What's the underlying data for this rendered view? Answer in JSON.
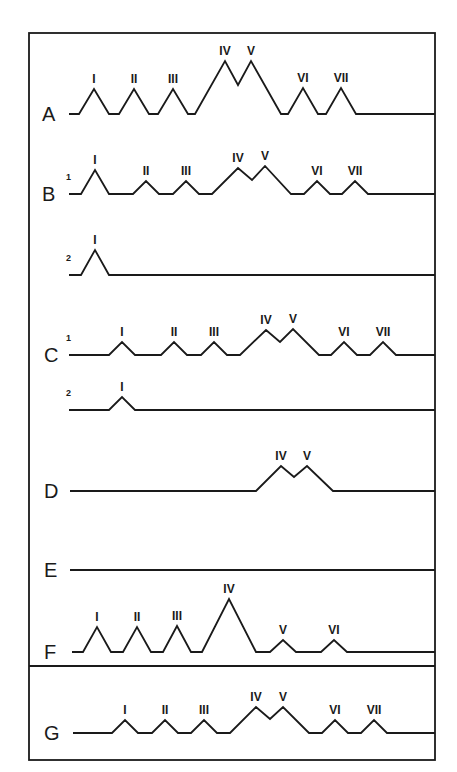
{
  "figure": {
    "frame": {
      "left": 29,
      "top": 33,
      "right": 435,
      "bottom": 760,
      "divider_y": 666
    },
    "stroke_color": "#1a1a1a",
    "background": "#ffffff",
    "rows": [
      {
        "id": "A",
        "label": "A",
        "label_x": 42,
        "baseline": 114,
        "start_x": 69,
        "peaks": [
          {
            "name": "I",
            "x": 94,
            "y": 89,
            "w": 15
          },
          {
            "name": "II",
            "x": 134,
            "y": 89,
            "w": 15
          },
          {
            "name": "III",
            "x": 173,
            "y": 89,
            "w": 15
          },
          {
            "name": "IV",
            "x": 225,
            "y": 61,
            "pair_valley": {
              "x": 238,
              "y": 85
            }
          },
          {
            "name": "V",
            "x": 251,
            "y": 61,
            "w": 30
          },
          {
            "name": "VI",
            "x": 303,
            "y": 88,
            "w": 15
          },
          {
            "name": "VII",
            "x": 341,
            "y": 88,
            "w": 15
          }
        ]
      },
      {
        "id": "B1",
        "label": "B",
        "label_x": 42,
        "sub": "1",
        "baseline": 194,
        "start_x": 69,
        "peaks": [
          {
            "name": "I",
            "x": 95,
            "y": 170,
            "w": 14
          },
          {
            "name": "II",
            "x": 146,
            "y": 181,
            "w": 13
          },
          {
            "name": "III",
            "x": 186,
            "y": 181,
            "w": 13
          },
          {
            "name": "IV",
            "x": 238,
            "y": 168,
            "pair_valley": {
              "x": 252,
              "y": 180
            }
          },
          {
            "name": "V",
            "x": 265,
            "y": 166,
            "w": 26
          },
          {
            "name": "VI",
            "x": 317,
            "y": 181,
            "w": 13
          },
          {
            "name": "VII",
            "x": 355,
            "y": 181,
            "w": 13
          }
        ]
      },
      {
        "id": "B2",
        "label": "",
        "sub": "2",
        "baseline": 275,
        "start_x": 69,
        "peaks": [
          {
            "name": "I",
            "x": 95,
            "y": 250,
            "w": 14
          }
        ]
      },
      {
        "id": "C1",
        "label": "C",
        "label_x": 44,
        "sub": "1",
        "baseline": 355,
        "start_x": 69,
        "peaks": [
          {
            "name": "I",
            "x": 122,
            "y": 342,
            "w": 13
          },
          {
            "name": "II",
            "x": 174,
            "y": 342,
            "w": 13
          },
          {
            "name": "III",
            "x": 214,
            "y": 342,
            "w": 13
          },
          {
            "name": "IV",
            "x": 266,
            "y": 330,
            "pair_valley": {
              "x": 280,
              "y": 342
            }
          },
          {
            "name": "V",
            "x": 293,
            "y": 329,
            "w": 26
          },
          {
            "name": "VI",
            "x": 344,
            "y": 342,
            "w": 13
          },
          {
            "name": "VII",
            "x": 383,
            "y": 342,
            "w": 13
          }
        ]
      },
      {
        "id": "C2",
        "label": "",
        "sub": "2",
        "baseline": 410,
        "start_x": 69,
        "peaks": [
          {
            "name": "I",
            "x": 122,
            "y": 397,
            "w": 13
          }
        ]
      },
      {
        "id": "D",
        "label": "D",
        "label_x": 44,
        "baseline": 491,
        "start_x": 70,
        "peaks": [
          {
            "name": "IV",
            "x": 281,
            "y": 466,
            "pair_valley": {
              "x": 294,
              "y": 477
            },
            "start_x": 256
          },
          {
            "name": "V",
            "x": 307,
            "y": 466,
            "w": 26
          }
        ]
      },
      {
        "id": "E",
        "label": "E",
        "label_x": 44,
        "baseline": 570,
        "start_x": 70,
        "peaks": []
      },
      {
        "id": "F",
        "label": "F",
        "label_x": 44,
        "baseline": 652,
        "start_x": 72,
        "peaks": [
          {
            "name": "I",
            "x": 97,
            "y": 627,
            "w": 14
          },
          {
            "name": "II",
            "x": 137,
            "y": 627,
            "w": 14
          },
          {
            "name": "III",
            "x": 177,
            "y": 626,
            "w": 14
          },
          {
            "name": "IV",
            "x": 229,
            "y": 599,
            "w": 27
          },
          {
            "name": "V",
            "x": 283,
            "y": 640,
            "w": 13
          },
          {
            "name": "VI",
            "x": 334,
            "y": 640,
            "w": 13
          }
        ]
      },
      {
        "id": "G",
        "label": "G",
        "label_x": 44,
        "baseline": 733,
        "start_x": 73,
        "peaks": [
          {
            "name": "I",
            "x": 125,
            "y": 720,
            "w": 13
          },
          {
            "name": "II",
            "x": 165,
            "y": 720,
            "w": 13
          },
          {
            "name": "III",
            "x": 204,
            "y": 720,
            "w": 13
          },
          {
            "name": "IV",
            "x": 256,
            "y": 707,
            "pair_valley": {
              "x": 270,
              "y": 719
            }
          },
          {
            "name": "V",
            "x": 283,
            "y": 707,
            "w": 26
          },
          {
            "name": "VI",
            "x": 335,
            "y": 720,
            "w": 13
          },
          {
            "name": "VII",
            "x": 374,
            "y": 720,
            "w": 13
          }
        ]
      }
    ]
  }
}
